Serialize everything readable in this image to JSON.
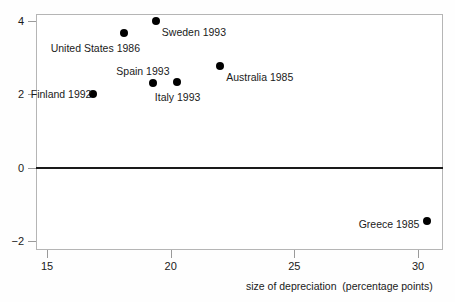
{
  "chart_data": {
    "type": "scatter",
    "title": "",
    "xlabel": "size of depreciation  (percentage points)",
    "ylabel": "",
    "xlim": [
      14.5,
      31.1
    ],
    "ylim": [
      -2.3,
      4.35
    ],
    "xticks": [
      "15",
      "20",
      "25",
      "30"
    ],
    "xtick_values": [
      15,
      20,
      25,
      30
    ],
    "yticks": [
      "4",
      "2",
      "0",
      "−2"
    ],
    "ytick_values": [
      4,
      2,
      0,
      -2
    ],
    "grid": false,
    "legend": null,
    "zero_line": 0,
    "points": [
      {
        "label": "Sweden 1993",
        "x": 19.4,
        "y": 4.0,
        "label_dx": 6,
        "label_dy": 6
      },
      {
        "label": "United States 1986",
        "x": 18.1,
        "y": 3.67,
        "label_dx": -73,
        "label_dy": 10
      },
      {
        "label": "Australia 1985",
        "x": 22.0,
        "y": 2.78,
        "label_dx": 6,
        "label_dy": 6
      },
      {
        "label": "Spain 1993",
        "x": 19.3,
        "y": 2.32,
        "label_dx": -37,
        "label_dy": -17
      },
      {
        "label": "Italy 1993",
        "x": 20.25,
        "y": 2.33,
        "label_dx": -22,
        "label_dy": 10
      },
      {
        "label": "Finland 1992",
        "x": 16.85,
        "y": 2.0,
        "label_dx": -62,
        "label_dy": -5
      },
      {
        "label": "Greece 1985",
        "x": 30.35,
        "y": -1.45,
        "label_dx": -68,
        "label_dy": -2
      }
    ]
  }
}
